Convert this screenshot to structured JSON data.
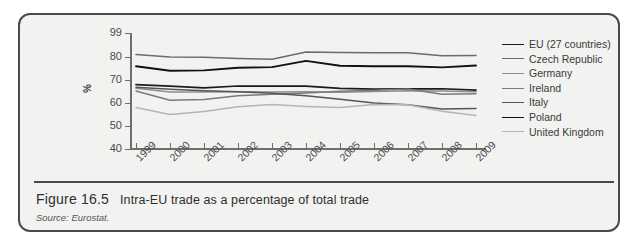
{
  "figure": {
    "number": "Figure 16.5",
    "title": "Intra-EU trade as a percentage of total trade",
    "source": "Source: Eurostat."
  },
  "chart_data": {
    "type": "line",
    "title": "Intra-EU trade as a percentage of total trade",
    "xlabel": "",
    "ylabel": "%",
    "categories": [
      "1999",
      "2000",
      "2001",
      "2002",
      "2003",
      "2004",
      "2005",
      "2006",
      "2007",
      "2008",
      "2009"
    ],
    "ylim": [
      40,
      99
    ],
    "yticks": [
      99,
      80,
      70,
      60,
      50,
      40
    ],
    "grid": false,
    "legend_position": "right",
    "series": [
      {
        "name": "EU (27 countries)",
        "color": "#1b1b1b",
        "width": 1.7,
        "values": [
          68.0,
          67.3,
          66.6,
          67.4,
          67.3,
          67.3,
          66.4,
          66.0,
          66.1,
          66.2,
          65.6
        ]
      },
      {
        "name": "Czech Republic",
        "color": "#6b6b6b",
        "width": 1.5,
        "values": [
          82.0,
          80.0,
          79.9,
          79.4,
          79.0,
          84.0,
          83.6,
          83.3,
          83.4,
          81.0,
          81.1
        ]
      },
      {
        "name": "Germany",
        "color": "#8e8e8e",
        "width": 1.5,
        "values": [
          66.4,
          64.8,
          64.8,
          64.9,
          64.8,
          64.9,
          64.7,
          65.0,
          65.3,
          65.2,
          64.9
        ]
      },
      {
        "name": "Ireland",
        "color": "#7a7a7a",
        "width": 1.5,
        "values": [
          65.2,
          61.2,
          61.5,
          63.2,
          63.8,
          64.4,
          65.1,
          65.5,
          66.1,
          63.8,
          64.0
        ]
      },
      {
        "name": "Italy",
        "color": "#555555",
        "width": 1.5,
        "values": [
          66.8,
          66.0,
          65.3,
          64.9,
          64.2,
          63.2,
          61.6,
          60.0,
          59.2,
          57.4,
          57.6
        ]
      },
      {
        "name": "Poland",
        "color": "#111111",
        "width": 1.9,
        "values": [
          76.0,
          74.0,
          74.2,
          75.3,
          75.6,
          78.3,
          76.2,
          76.0,
          76.0,
          75.5,
          76.3
        ]
      },
      {
        "name": "United Kingdom",
        "color": "#b4b4b4",
        "width": 1.5,
        "values": [
          58.0,
          55.0,
          56.3,
          58.4,
          59.3,
          58.5,
          58.0,
          59.4,
          59.2,
          56.4,
          54.6
        ]
      }
    ]
  }
}
